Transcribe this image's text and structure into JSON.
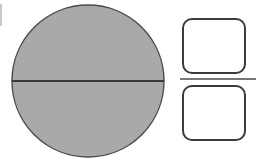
{
  "figure": {
    "background_color": "#ffffff",
    "width": 257,
    "height": 165
  },
  "colors": {
    "shape_fill_gray": "#a9a9a9",
    "shape_fill_white": "#ffffff",
    "outline_dark": "#3b3b3b",
    "outline_medium": "#555555",
    "separator": "#4a4a4a",
    "edge_mark": "#b5b5b5",
    "background": "#ffffff"
  },
  "shapes": {
    "circle": {
      "name": "bisected-circle",
      "center_x": 88,
      "center_y": 81,
      "radius": 76,
      "fill": "#a9a9a9",
      "stroke": "#4a4a4a",
      "stroke_width": 1.4
    },
    "diameter_line": {
      "name": "horizontal-diameter",
      "x1": 12,
      "y1": 81,
      "x2": 164,
      "y2": 81,
      "stroke": "#3b3b3b",
      "stroke_width": 2
    },
    "rounded_rect_top": {
      "name": "top-rounded-rectangle",
      "x": 183,
      "y": 19,
      "width": 62,
      "height": 54,
      "corner_radius": 9,
      "fill": "#ffffff",
      "stroke": "#3b3b3b",
      "stroke_width": 2
    },
    "rounded_rect_bottom": {
      "name": "bottom-rounded-rectangle",
      "x": 183,
      "y": 86,
      "width": 62,
      "height": 54,
      "corner_radius": 9,
      "fill": "#ffffff",
      "stroke": "#3b3b3b",
      "stroke_width": 2
    },
    "separator_line": {
      "name": "rectangle-separator",
      "x1": 180,
      "y1": 79,
      "x2": 256,
      "y2": 79,
      "stroke": "#4a4a4a",
      "stroke_width": 1.4
    },
    "left_edge_mark": {
      "name": "left-edge-artifact",
      "x1": 1,
      "y1": 4,
      "x2": 1,
      "y2": 26,
      "stroke": "#c9c9c9",
      "stroke_width": 2
    }
  }
}
